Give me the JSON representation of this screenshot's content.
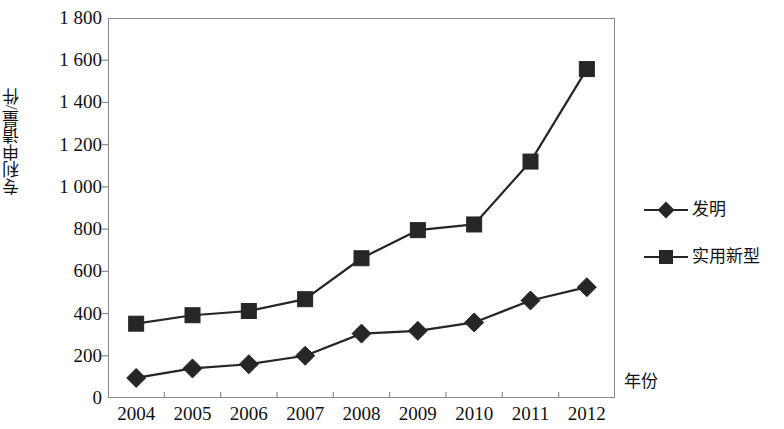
{
  "chart_data": {
    "type": "line",
    "title": "",
    "xlabel": "年份",
    "ylabel": "专利申请量/件",
    "categories": [
      "2004",
      "2005",
      "2006",
      "2007",
      "2008",
      "2009",
      "2010",
      "2011",
      "2012"
    ],
    "series": [
      {
        "name": "发明",
        "marker": "diamond",
        "color": "#262626",
        "values": [
          95,
          140,
          160,
          200,
          305,
          318,
          358,
          462,
          525
        ]
      },
      {
        "name": "实用新型",
        "marker": "square",
        "color": "#262626",
        "values": [
          352,
          392,
          412,
          468,
          662,
          795,
          822,
          1120,
          1558
        ]
      }
    ],
    "ylim": [
      0,
      1800
    ],
    "ytick_step": 200,
    "yticks": [
      "0",
      "200",
      "400",
      "600",
      "800",
      "1 000",
      "1 200",
      "1 400",
      "1 600",
      "1 800"
    ],
    "grid": false,
    "legend_position": "right"
  },
  "legend": {
    "items": [
      {
        "label": "发明",
        "marker": "diamond"
      },
      {
        "label": "实用新型",
        "marker": "square"
      }
    ]
  },
  "axes": {
    "y_title": "专利申请量/件",
    "x_title": "年份"
  }
}
